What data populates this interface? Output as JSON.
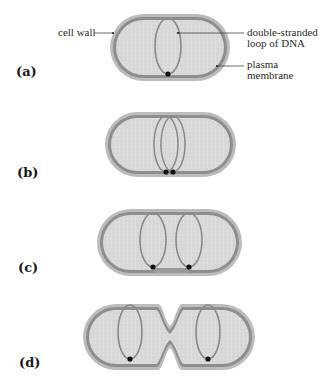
{
  "figure": {
    "colors": {
      "cell_wall": "#b8b8b8",
      "plasma_membrane": "#8c8c8c",
      "cytoplasm": "#d9d9d9",
      "dna_loop": "#8a8a8a",
      "attachment_point": "#111111",
      "leader_line": "#444444"
    },
    "annotations": {
      "cell_wall": "cell wall",
      "dna_line1": "double-stranded",
      "dna_line2": "loop of DNA",
      "membrane_line1": "plasma",
      "membrane_line2": "membrane"
    },
    "panels": [
      {
        "label": "(a)",
        "stage": "single DNA loop attached to membrane",
        "cell": {
          "x": 110,
          "y": 14,
          "w": 120,
          "h": 67
        },
        "loops": [
          {
            "cx": 168,
            "cy": 45,
            "rx": 13,
            "ry": 28
          }
        ],
        "dots": [
          [
            168,
            74
          ]
        ]
      },
      {
        "label": "(b)",
        "stage": "DNA replicated, two loops attached side by side",
        "cell": {
          "x": 105,
          "y": 112,
          "w": 131,
          "h": 65
        },
        "loops": [
          {
            "cx": 166,
            "cy": 142,
            "rx": 12,
            "ry": 28
          },
          {
            "cx": 172,
            "cy": 142,
            "rx": 12,
            "ry": 28
          }
        ],
        "dots": [
          [
            166,
            172
          ],
          [
            173,
            172
          ]
        ]
      },
      {
        "label": "(c)",
        "stage": "cell elongates, loops separate",
        "cell": {
          "x": 97,
          "y": 209,
          "w": 145,
          "h": 67
        },
        "loops": [
          {
            "cx": 153,
            "cy": 238,
            "rx": 13,
            "ry": 28
          },
          {
            "cx": 189,
            "cy": 238,
            "rx": 13,
            "ry": 28
          }
        ],
        "dots": [
          [
            153,
            267
          ],
          [
            189,
            267
          ]
        ]
      },
      {
        "label": "(d)",
        "stage": "membrane and wall pinch inward, dividing the cell",
        "cell": {
          "x": 83,
          "y": 304,
          "w": 172,
          "h": 66
        },
        "loops": [
          {
            "cx": 130,
            "cy": 331,
            "rx": 12,
            "ry": 27
          },
          {
            "cx": 209,
            "cy": 331,
            "rx": 12,
            "ry": 27
          }
        ],
        "dots": [
          [
            130,
            359
          ],
          [
            208,
            359
          ]
        ]
      }
    ]
  }
}
